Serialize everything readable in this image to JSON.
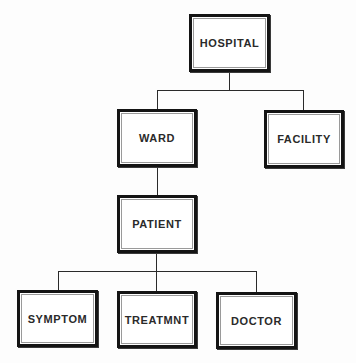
{
  "diagram": {
    "type": "hierarchy-tree",
    "root": "HOSPITAL",
    "nodes": [
      {
        "id": "hospital",
        "label": "HOSPITAL",
        "parent": null,
        "level": 0
      },
      {
        "id": "ward",
        "label": "WARD",
        "parent": "hospital",
        "level": 1
      },
      {
        "id": "facility",
        "label": "FACILITY",
        "parent": "hospital",
        "level": 1
      },
      {
        "id": "patient",
        "label": "PATIENT",
        "parent": "ward",
        "level": 2
      },
      {
        "id": "symptom",
        "label": "SYMPTOM",
        "parent": "patient",
        "level": 3
      },
      {
        "id": "treatmnt",
        "label": "TREATMNT",
        "parent": "patient",
        "level": 3
      },
      {
        "id": "doctor",
        "label": "DOCTOR",
        "parent": "patient",
        "level": 3
      }
    ],
    "edges": [
      {
        "from": "hospital",
        "to": "ward"
      },
      {
        "from": "hospital",
        "to": "facility"
      },
      {
        "from": "ward",
        "to": "patient"
      },
      {
        "from": "patient",
        "to": "symptom"
      },
      {
        "from": "patient",
        "to": "treatmnt"
      },
      {
        "from": "patient",
        "to": "doctor"
      }
    ],
    "caption": ""
  },
  "colors": {
    "border": "#141414",
    "inner_border": "#9a9a9a",
    "line": "#2a2a2a",
    "text": "#2a2a2a",
    "background": "#fdfdfd"
  }
}
